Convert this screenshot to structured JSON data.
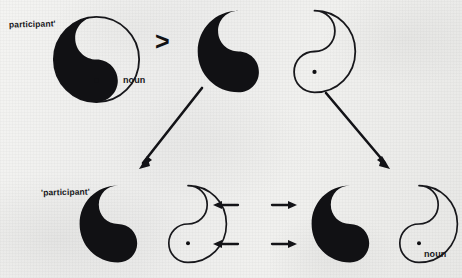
{
  "figure": {
    "medium": "scanned paper diagram",
    "background_color": "#efefed",
    "ink_color": "#111114",
    "relation_symbol": ">",
    "description_type": "diagram"
  },
  "labels": {
    "participant_top": "participant'",
    "noun_top": "noun",
    "participant_bottom": "'participant'",
    "noun_bottom": "noun"
  },
  "nodes": [
    {
      "id": "top-left-whole",
      "kind": "yin-yang-whole",
      "labels": [
        "participant'",
        "noun"
      ],
      "has_dot": true
    },
    {
      "id": "top-right-split",
      "kind": "yin-yang-split",
      "left_half": "solid",
      "right_half": "outline",
      "has_dot": true
    },
    {
      "id": "bottom-left-split",
      "kind": "yin-yang-split",
      "left_half": "solid",
      "right_half": "outline",
      "labels": [
        "'participant'"
      ],
      "has_dot": true
    },
    {
      "id": "bottom-right-split",
      "kind": "yin-yang-split",
      "left_half": "solid",
      "right_half": "outline",
      "labels": [
        "noun"
      ],
      "has_dot": true
    }
  ],
  "arrows": {
    "diagonal_left": "down-left",
    "diagonal_right": "down-right",
    "inner_left_upper": "left",
    "inner_left_lower": "left",
    "inner_right_upper": "right",
    "inner_right_lower": "right"
  }
}
